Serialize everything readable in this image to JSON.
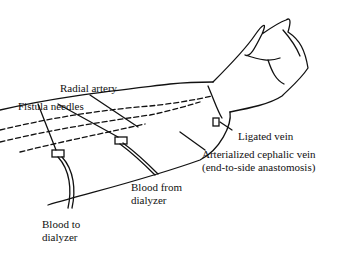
{
  "diagram": {
    "labels": {
      "radial_artery": "Radial artery",
      "fistula_needles": "Fistula needles",
      "ligated_vein": "Ligated vein",
      "arterialized_vein_line1": "Arterialized cephalic vein",
      "arterialized_vein_line2": "(end-to-side anastomosis)",
      "blood_from_line1": "Blood from",
      "blood_from_line2": "dialyzer",
      "blood_to_line1": "Blood to",
      "blood_to_line2": "dialyzer"
    }
  }
}
